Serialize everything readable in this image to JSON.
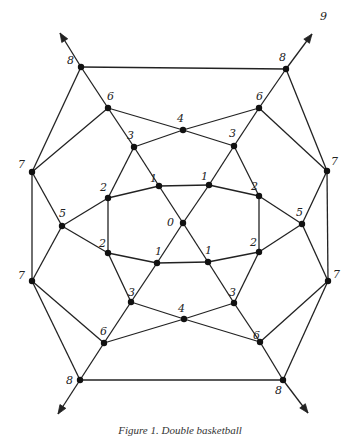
{
  "figure": {
    "caption": "Figure 1. Double basketball",
    "line_color": "#222222",
    "vertex_color": "#111111",
    "vertices": [
      {
        "id": "8TL",
        "label": "8"
      },
      {
        "id": "8TR",
        "label": "8"
      },
      {
        "id": "6TL",
        "label": "6"
      },
      {
        "id": "6TR",
        "label": "6"
      },
      {
        "id": "4T",
        "label": "4"
      },
      {
        "id": "3TL",
        "label": "3"
      },
      {
        "id": "3TR",
        "label": "3"
      },
      {
        "id": "1TL",
        "label": "1"
      },
      {
        "id": "1TR",
        "label": "1"
      },
      {
        "id": "2TL",
        "label": "2"
      },
      {
        "id": "2TR",
        "label": "2"
      },
      {
        "id": "0",
        "label": "0"
      },
      {
        "id": "5L",
        "label": "5"
      },
      {
        "id": "5R",
        "label": "5"
      },
      {
        "id": "7TL",
        "label": "7"
      },
      {
        "id": "7TR",
        "label": "7"
      },
      {
        "id": "7BL",
        "label": "7"
      },
      {
        "id": "7BR",
        "label": "7"
      },
      {
        "id": "2BL",
        "label": "2"
      },
      {
        "id": "2BR",
        "label": "2"
      },
      {
        "id": "1BL",
        "label": "1"
      },
      {
        "id": "1BR",
        "label": "1"
      },
      {
        "id": "3BL",
        "label": "3"
      },
      {
        "id": "3BR",
        "label": "3"
      },
      {
        "id": "4B",
        "label": "4"
      },
      {
        "id": "6BL",
        "label": "6"
      },
      {
        "id": "6BR",
        "label": "6"
      },
      {
        "id": "8BL",
        "label": "8"
      },
      {
        "id": "8BR",
        "label": "8"
      }
    ],
    "edges": [
      [
        "8TL",
        "8TR"
      ],
      [
        "8TL",
        "6TL"
      ],
      [
        "8TL",
        "7TL"
      ],
      [
        "8TR",
        "6TR"
      ],
      [
        "8TR",
        "7TR"
      ],
      [
        "6TL",
        "4T"
      ],
      [
        "6TL",
        "3TL"
      ],
      [
        "6TL",
        "7TL"
      ],
      [
        "6TR",
        "4T"
      ],
      [
        "6TR",
        "3TR"
      ],
      [
        "6TR",
        "7TR"
      ],
      [
        "4T",
        "3TL"
      ],
      [
        "4T",
        "3TR"
      ],
      [
        "3TL",
        "1TL"
      ],
      [
        "3TL",
        "2TL"
      ],
      [
        "3TR",
        "1TR"
      ],
      [
        "3TR",
        "2TR"
      ],
      [
        "1TL",
        "1TR"
      ],
      [
        "1TL",
        "0"
      ],
      [
        "1TL",
        "2TL"
      ],
      [
        "1TR",
        "0"
      ],
      [
        "1TR",
        "2TR"
      ],
      [
        "2TL",
        "5L"
      ],
      [
        "2TL",
        "2BL"
      ],
      [
        "2TR",
        "5R"
      ],
      [
        "2TR",
        "2BR"
      ],
      [
        "5L",
        "7TL"
      ],
      [
        "5L",
        "7BL"
      ],
      [
        "5L",
        "2BL"
      ],
      [
        "5R",
        "7TR"
      ],
      [
        "5R",
        "7BR"
      ],
      [
        "5R",
        "2BR"
      ],
      [
        "7TL",
        "7BL"
      ],
      [
        "7TR",
        "7BR"
      ],
      [
        "0",
        "1BL"
      ],
      [
        "0",
        "1BR"
      ],
      [
        "1BL",
        "1BR"
      ],
      [
        "1BL",
        "2BL"
      ],
      [
        "1BL",
        "3BL"
      ],
      [
        "1BR",
        "2BR"
      ],
      [
        "1BR",
        "3BR"
      ],
      [
        "2BL",
        "3BL"
      ],
      [
        "2BR",
        "3BR"
      ],
      [
        "3BL",
        "4B"
      ],
      [
        "3BL",
        "6BL"
      ],
      [
        "3BR",
        "4B"
      ],
      [
        "3BR",
        "6BR"
      ],
      [
        "4B",
        "6BL"
      ],
      [
        "4B",
        "6BR"
      ],
      [
        "6BL",
        "7BL"
      ],
      [
        "6BL",
        "8BL"
      ],
      [
        "6BR",
        "7BR"
      ],
      [
        "6BR",
        "8BR"
      ],
      [
        "7BL",
        "8BL"
      ],
      [
        "7BR",
        "8BR"
      ],
      [
        "8BL",
        "8BR"
      ]
    ],
    "arrows": [
      {
        "from": "8TL",
        "direction": "up-left"
      },
      {
        "from": "8TR",
        "direction": "up-right",
        "label": "9"
      },
      {
        "from": "8BL",
        "direction": "down-left"
      },
      {
        "from": "8BR",
        "direction": "down-right"
      }
    ]
  }
}
